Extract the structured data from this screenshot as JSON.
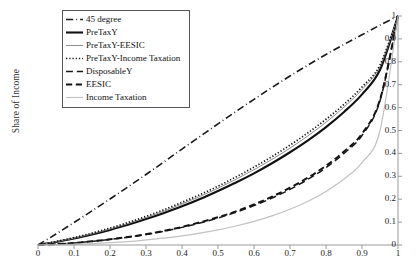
{
  "chart_data": {
    "type": "line",
    "title": "",
    "xlabel": "",
    "ylabel": "Share of Income",
    "xlim": [
      0,
      1
    ],
    "ylim": [
      0,
      1
    ],
    "grid": false,
    "legend_position": "top-left",
    "y_axis_side": "right",
    "xticks": [
      "0",
      "0.1",
      "0.2",
      "0.3",
      "0.4",
      "0.5",
      "0.6",
      "0.7",
      "0.8",
      "0.9",
      "1"
    ],
    "xtick_values": [
      0,
      0.1,
      0.2,
      0.3,
      0.4,
      0.5,
      0.6,
      0.7,
      0.8,
      0.9,
      1
    ],
    "yticks": [
      "0",
      "0.1",
      "0.2",
      "0.3",
      "0.4",
      "0.5",
      "0.6",
      "0.7",
      "0.8",
      "0.9",
      "1"
    ],
    "ytick_values": [
      0,
      0.1,
      0.2,
      0.3,
      0.4,
      0.5,
      0.6,
      0.7,
      0.8,
      0.9,
      1
    ],
    "x": [
      0,
      0.05,
      0.1,
      0.15,
      0.2,
      0.25,
      0.3,
      0.35,
      0.4,
      0.45,
      0.5,
      0.55,
      0.6,
      0.65,
      0.7,
      0.75,
      0.8,
      0.85,
      0.9,
      0.95,
      1
    ],
    "series": [
      {
        "name": "45 degree",
        "style": "dashdot",
        "color": "#1a1a1a",
        "width": 1.6,
        "values": [
          0,
          0.048,
          0.098,
          0.149,
          0.201,
          0.254,
          0.308,
          0.363,
          0.419,
          0.474,
          0.529,
          0.583,
          0.636,
          0.688,
          0.738,
          0.786,
          0.832,
          0.876,
          0.918,
          0.96,
          1
        ]
      },
      {
        "name": "PreTaxY",
        "style": "solid",
        "color": "#111111",
        "width": 2.1,
        "values": [
          0,
          0.013,
          0.028,
          0.046,
          0.066,
          0.088,
          0.113,
          0.14,
          0.169,
          0.201,
          0.236,
          0.273,
          0.313,
          0.357,
          0.405,
          0.457,
          0.515,
          0.581,
          0.658,
          0.765,
          1
        ]
      },
      {
        "name": "PreTaxY-EESIC",
        "style": "solid",
        "color": "#8f8f8f",
        "width": 1.0,
        "values": [
          0,
          0.014,
          0.03,
          0.049,
          0.07,
          0.094,
          0.12,
          0.148,
          0.179,
          0.212,
          0.248,
          0.287,
          0.329,
          0.374,
          0.423,
          0.477,
          0.536,
          0.602,
          0.679,
          0.78,
          1
        ]
      },
      {
        "name": "PreTaxY-Income Taxation",
        "style": "dotted",
        "color": "#151515",
        "width": 1.7,
        "values": [
          0,
          0.015,
          0.032,
          0.052,
          0.074,
          0.098,
          0.125,
          0.154,
          0.186,
          0.22,
          0.257,
          0.297,
          0.34,
          0.386,
          0.436,
          0.49,
          0.549,
          0.614,
          0.69,
          0.786,
          1
        ]
      },
      {
        "name": "DisposableY",
        "style": "dashed-long",
        "color": "#1a1a1a",
        "width": 1.5,
        "values": [
          0,
          0.004,
          0.009,
          0.016,
          0.024,
          0.034,
          0.046,
          0.06,
          0.077,
          0.096,
          0.118,
          0.143,
          0.172,
          0.205,
          0.243,
          0.287,
          0.338,
          0.4,
          0.478,
          0.63,
          1
        ]
      },
      {
        "name": "EESIC",
        "style": "dashed",
        "color": "#141414",
        "width": 2.0,
        "values": [
          0,
          0.004,
          0.009,
          0.016,
          0.025,
          0.035,
          0.047,
          0.062,
          0.079,
          0.099,
          0.121,
          0.147,
          0.177,
          0.211,
          0.25,
          0.294,
          0.346,
          0.408,
          0.486,
          0.635,
          1
        ]
      },
      {
        "name": "Income Taxation",
        "style": "solid",
        "color": "#c2c2c2",
        "width": 1.2,
        "values": [
          0,
          0.001,
          0.003,
          0.006,
          0.01,
          0.015,
          0.022,
          0.03,
          0.04,
          0.052,
          0.066,
          0.083,
          0.103,
          0.127,
          0.156,
          0.191,
          0.234,
          0.288,
          0.36,
          0.5,
          1
        ]
      }
    ]
  },
  "legend": {
    "items": [
      {
        "label": "45 degree"
      },
      {
        "label": "PreTaxY"
      },
      {
        "label": "PreTaxY-EESIC"
      },
      {
        "label": "PreTaxY-Income Taxation"
      },
      {
        "label": "DisposableY"
      },
      {
        "label": "EESIC"
      },
      {
        "label": "Income Taxation"
      }
    ]
  },
  "axis": {
    "y_title": "Share of Income",
    "axis_color": "#9a9a9a"
  }
}
